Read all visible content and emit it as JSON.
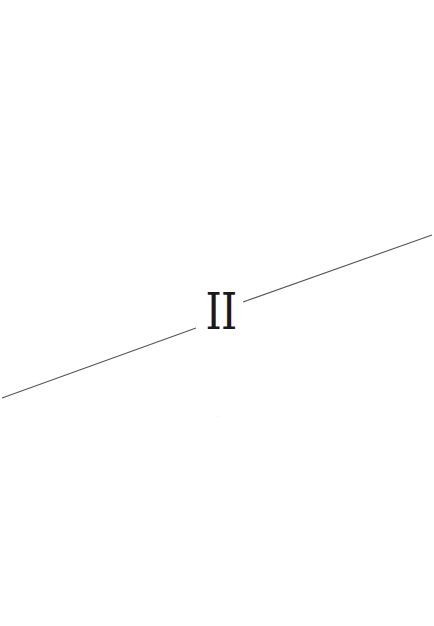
{
  "page": {
    "type": "part-divider",
    "part_numeral": "II",
    "background_color": "#ffffff",
    "text_color": "#1a1a1a",
    "rule_color": "#555555"
  }
}
